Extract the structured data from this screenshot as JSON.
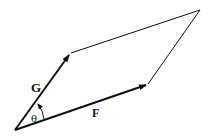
{
  "diagram": {
    "type": "parallelogram-vector-addition",
    "labels": {
      "G": "G",
      "F": "F",
      "theta": "θ"
    },
    "points": {
      "origin": [
        15,
        130
      ],
      "G_tip": [
        70,
        53
      ],
      "F_tip": [
        147,
        84
      ],
      "far_corner": [
        200,
        10
      ]
    },
    "colors": {
      "stroke": "#111111",
      "background": "#ffffff"
    }
  }
}
